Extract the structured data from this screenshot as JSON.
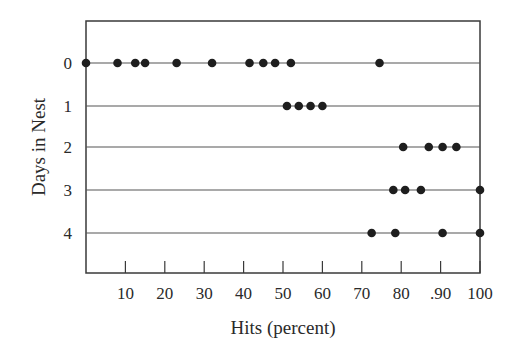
{
  "chart_data": {
    "type": "scatter",
    "subtype": "dot-plot",
    "title": "",
    "xlabel": "Hits (percent)",
    "ylabel": "Days in Nest",
    "xlim": [
      0,
      100
    ],
    "x_ticks": [
      10,
      20,
      30,
      40,
      50,
      60,
      70,
      80,
      90,
      100
    ],
    "x_tick_labels": [
      "10",
      "20",
      "30",
      "40",
      "50",
      "60",
      "70",
      "80",
      ".90",
      "100"
    ],
    "y_categories": [
      "0",
      "1",
      "2",
      "3",
      "4"
    ],
    "y_inverted": true,
    "grid": "horizontal lines at each category",
    "legend": null,
    "series": [
      {
        "name": "0",
        "values": [
          0,
          8,
          12.5,
          15,
          23,
          32,
          41.5,
          45,
          48,
          52,
          74.5
        ]
      },
      {
        "name": "1",
        "values": [
          51,
          54,
          57,
          60
        ]
      },
      {
        "name": "2",
        "values": [
          80.5,
          87,
          90.5,
          94
        ]
      },
      {
        "name": "3",
        "values": [
          78,
          81,
          85,
          100
        ]
      },
      {
        "name": "4",
        "values": [
          72.5,
          78.5,
          90.5,
          100
        ]
      }
    ]
  },
  "colors": {
    "ink": "#2a2a2a",
    "dot": "#1e1e1e",
    "frame": "#3a3a3a"
  }
}
